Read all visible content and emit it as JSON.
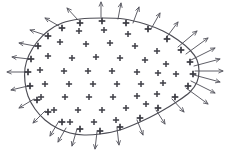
{
  "figure": {
    "title": "Gaussian surface with enclosed positive charge and outward electric flux",
    "caption": "",
    "width": 231,
    "height": 166,
    "background_color": "#ffffff",
    "boundary_color": "#4d4d55",
    "arrow_color": "#56565f",
    "charge_color": "#3f3f47",
    "charge_symbol": "+",
    "surface_shape": "closed teardrop / egg outline, rounded bulb at left, narrow rounded tip at right"
  },
  "chart_data": {
    "type": "scatter",
    "title": "Gaussian surface with enclosed positive charge and outward electric flux",
    "xlabel": "",
    "ylabel": "",
    "xlim": [
      0,
      231
    ],
    "ylim": [
      0,
      166
    ],
    "grid": false,
    "legend": "none",
    "annotations": [],
    "boundary_outline": [
      [
        103,
        18
      ],
      [
        124,
        19
      ],
      [
        145,
        24
      ],
      [
        163,
        31
      ],
      [
        178,
        40
      ],
      [
        190,
        50
      ],
      [
        197,
        60
      ],
      [
        199,
        71
      ],
      [
        197,
        82
      ],
      [
        190,
        92
      ],
      [
        178,
        101
      ],
      [
        160,
        112
      ],
      [
        140,
        122
      ],
      [
        120,
        130
      ],
      [
        100,
        134
      ],
      [
        84,
        135
      ],
      [
        70,
        133
      ],
      [
        57,
        128
      ],
      [
        45,
        120
      ],
      [
        35,
        109
      ],
      [
        28,
        96
      ],
      [
        25,
        82
      ],
      [
        25,
        68
      ],
      [
        29,
        55
      ],
      [
        37,
        42
      ],
      [
        48,
        31
      ],
      [
        62,
        23
      ],
      [
        80,
        19
      ],
      [
        103,
        18
      ]
    ],
    "charges": {
      "symbol": "+",
      "count": 62,
      "description": "Positive charges distributed in a staggered grid filling the interior of the closed surface, with a denser ring of plus marks riding along the boundary itself.",
      "interior_points": [
        [
          79,
          31
        ],
        [
          104,
          30
        ],
        [
          128,
          34
        ],
        [
          60,
          42
        ],
        [
          86,
          44
        ],
        [
          110,
          43
        ],
        [
          135,
          46
        ],
        [
          157,
          51
        ],
        [
          48,
          56
        ],
        [
          72,
          58
        ],
        [
          96,
          57
        ],
        [
          120,
          58
        ],
        [
          145,
          60
        ],
        [
          166,
          64
        ],
        [
          40,
          70
        ],
        [
          64,
          71
        ],
        [
          88,
          71
        ],
        [
          112,
          71
        ],
        [
          137,
          72
        ],
        [
          158,
          73
        ],
        [
          176,
          74
        ],
        [
          45,
          84
        ],
        [
          69,
          84
        ],
        [
          93,
          84
        ],
        [
          117,
          84
        ],
        [
          141,
          84
        ],
        [
          163,
          83
        ],
        [
          41,
          97
        ],
        [
          65,
          97
        ],
        [
          89,
          97
        ],
        [
          113,
          97
        ],
        [
          137,
          96
        ],
        [
          157,
          94
        ],
        [
          54,
          110
        ],
        [
          78,
          110
        ],
        [
          102,
          110
        ],
        [
          126,
          108
        ],
        [
          146,
          104
        ],
        [
          70,
          122
        ],
        [
          94,
          122
        ],
        [
          116,
          120
        ]
      ],
      "boundary_points": [
        [
          102,
          21
        ],
        [
          80,
          23
        ],
        [
          62,
          28
        ],
        [
          48,
          36
        ],
        [
          38,
          46
        ],
        [
          31,
          59
        ],
        [
          28,
          72
        ],
        [
          30,
          86
        ],
        [
          37,
          100
        ],
        [
          48,
          112
        ],
        [
          62,
          122
        ],
        [
          80,
          129
        ],
        [
          100,
          131
        ],
        [
          120,
          127
        ],
        [
          140,
          118
        ],
        [
          158,
          108
        ],
        [
          175,
          97
        ],
        [
          188,
          86
        ],
        [
          193,
          74
        ],
        [
          190,
          62
        ],
        [
          181,
          50
        ],
        [
          167,
          39
        ],
        [
          148,
          29
        ],
        [
          126,
          23
        ]
      ]
    },
    "flux_arrows": {
      "description": "Electric field arrows emanating outward, normal to the closed surface. Longer and densest in a radiating fan at the narrow right tip where field lines converge.",
      "count": 30,
      "vectors": [
        {
          "x1": 101,
          "y1": 17,
          "x2": 101,
          "y2": 2,
          "length": 15,
          "region": "top",
          "note": "prominent vertical arrow at apex"
        },
        {
          "x1": 78,
          "y1": 20,
          "x2": 67,
          "y2": 8,
          "length": 16,
          "region": "top-left"
        },
        {
          "x1": 59,
          "y1": 26,
          "x2": 45,
          "y2": 18,
          "length": 16,
          "region": "upper-left"
        },
        {
          "x1": 45,
          "y1": 35,
          "x2": 30,
          "y2": 30,
          "length": 16,
          "region": "upper-left"
        },
        {
          "x1": 35,
          "y1": 46,
          "x2": 19,
          "y2": 43,
          "length": 16,
          "region": "left"
        },
        {
          "x1": 29,
          "y1": 59,
          "x2": 12,
          "y2": 57,
          "length": 17,
          "region": "left"
        },
        {
          "x1": 26,
          "y1": 72,
          "x2": 7,
          "y2": 72,
          "length": 19,
          "region": "left",
          "note": "horizontal leftward arrow"
        },
        {
          "x1": 28,
          "y1": 86,
          "x2": 11,
          "y2": 90,
          "length": 17,
          "region": "lower-left"
        },
        {
          "x1": 34,
          "y1": 99,
          "x2": 19,
          "y2": 108,
          "length": 17,
          "region": "lower-left"
        },
        {
          "x1": 45,
          "y1": 111,
          "x2": 33,
          "y2": 123,
          "length": 17,
          "region": "bottom-left"
        },
        {
          "x1": 59,
          "y1": 121,
          "x2": 50,
          "y2": 136,
          "length": 17,
          "region": "bottom-left"
        },
        {
          "x1": 77,
          "y1": 129,
          "x2": 72,
          "y2": 146,
          "length": 17,
          "region": "bottom"
        },
        {
          "x1": 97,
          "y1": 132,
          "x2": 95,
          "y2": 149,
          "length": 17,
          "region": "bottom"
        },
        {
          "x1": 117,
          "y1": 128,
          "x2": 119,
          "y2": 145,
          "length": 17,
          "region": "bottom"
        },
        {
          "x1": 137,
          "y1": 120,
          "x2": 143,
          "y2": 135,
          "length": 16,
          "region": "bottom-right"
        },
        {
          "x1": 156,
          "y1": 110,
          "x2": 165,
          "y2": 124,
          "length": 17,
          "region": "bottom-right"
        },
        {
          "x1": 172,
          "y1": 99,
          "x2": 184,
          "y2": 112,
          "length": 18,
          "region": "lower-right fan"
        },
        {
          "x1": 186,
          "y1": 88,
          "x2": 208,
          "y2": 104,
          "length": 27,
          "region": "right fan"
        },
        {
          "x1": 191,
          "y1": 81,
          "x2": 215,
          "y2": 93,
          "length": 27,
          "region": "right fan"
        },
        {
          "x1": 194,
          "y1": 75,
          "x2": 220,
          "y2": 82,
          "length": 27,
          "region": "right fan"
        },
        {
          "x1": 195,
          "y1": 71,
          "x2": 223,
          "y2": 71,
          "length": 28,
          "region": "right fan",
          "note": "horizontal rightward arrow"
        },
        {
          "x1": 194,
          "y1": 66,
          "x2": 220,
          "y2": 59,
          "length": 27,
          "region": "right fan"
        },
        {
          "x1": 191,
          "y1": 60,
          "x2": 215,
          "y2": 48,
          "length": 27,
          "region": "right fan"
        },
        {
          "x1": 186,
          "y1": 54,
          "x2": 208,
          "y2": 38,
          "length": 27,
          "region": "right fan"
        },
        {
          "x1": 178,
          "y1": 47,
          "x2": 197,
          "y2": 31,
          "length": 25,
          "region": "upper-right fan"
        },
        {
          "x1": 166,
          "y1": 38,
          "x2": 178,
          "y2": 22,
          "length": 20,
          "region": "upper-right"
        },
        {
          "x1": 151,
          "y1": 29,
          "x2": 160,
          "y2": 13,
          "length": 18,
          "region": "upper-right"
        },
        {
          "x1": 133,
          "y1": 23,
          "x2": 139,
          "y2": 7,
          "length": 17,
          "region": "top-right"
        },
        {
          "x1": 118,
          "y1": 19,
          "x2": 121,
          "y2": 3,
          "length": 16,
          "region": "top-right"
        },
        {
          "x1": 66,
          "y1": 128,
          "x2": 58,
          "y2": 142,
          "length": 16,
          "region": "bottom-left"
        }
      ]
    }
  }
}
